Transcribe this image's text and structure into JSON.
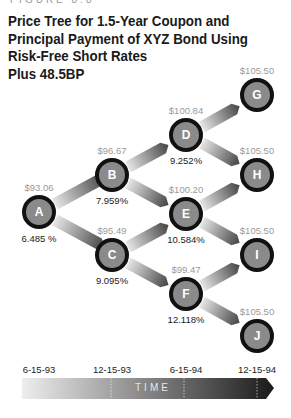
{
  "figure": {
    "label": "FIGURE 8.8",
    "title_lines": [
      "Price Tree for 1.5-Year Coupon and",
      "Principal Payment of XYZ Bond Using",
      "Risk-Free Short Rates",
      "Plus 48.5BP"
    ]
  },
  "nodes": {
    "A": {
      "label": "A",
      "price": "$93.06",
      "rate": "6.485 %"
    },
    "B": {
      "label": "B",
      "price": "$96.67",
      "rate": "7.959%"
    },
    "C": {
      "label": "C",
      "price": "$95.49",
      "rate": "9.095%"
    },
    "D": {
      "label": "D",
      "price": "$100.84",
      "rate": "9.252%"
    },
    "E": {
      "label": "E",
      "price": "$100.20",
      "rate": "10.584%"
    },
    "F": {
      "label": "F",
      "price": "$99.47",
      "rate": "12.118%"
    },
    "G": {
      "label": "G",
      "price": "$105.50"
    },
    "H": {
      "label": "H",
      "price": "$105.50"
    },
    "I": {
      "label": "I",
      "price": "$105.50"
    },
    "J": {
      "label": "J",
      "price": "$105.50"
    }
  },
  "timeline": {
    "label": "TIME",
    "ticks": [
      "6-15-93",
      "12-15-93",
      "6-15-94",
      "12-15-94"
    ]
  },
  "colors": {
    "node_fill": "#8a8a8a",
    "node_ring": "#111111",
    "price_text": "#9a9a9a"
  }
}
